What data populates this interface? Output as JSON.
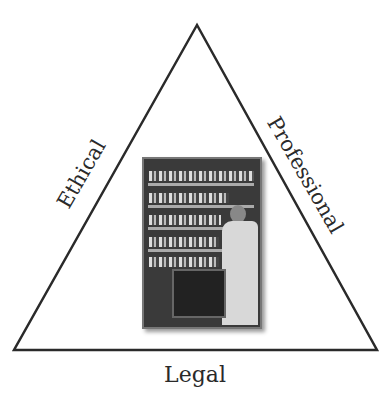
{
  "diagram": {
    "shape": "triangle",
    "stroke_color": "#2a2a2a",
    "vertices": {
      "apex": [
        197,
        25
      ],
      "bottom_left": [
        14,
        350
      ],
      "bottom_right": [
        377,
        350
      ]
    },
    "labels": {
      "left_side": "Ethical",
      "right_side": "Professional",
      "bottom": "Legal"
    },
    "center_image": {
      "description": "Pharmacist in white coat standing beside shelves of medicine bottles with a cart",
      "style": "grayscale photo"
    }
  }
}
